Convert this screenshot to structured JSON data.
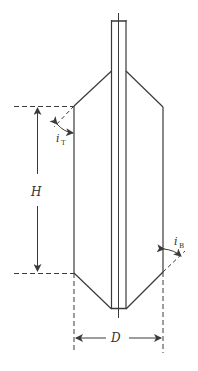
{
  "diagram": {
    "type": "technical cross-section of cylindrical vessel with conical top and bottom and central rod",
    "colors": {
      "stroke": "#3a3a3a",
      "background": "#ffffff"
    },
    "labels": {
      "height": "H",
      "diameter": "D",
      "top_angle": "i",
      "top_angle_sub": "T",
      "bottom_angle": "i",
      "bottom_angle_sub": "B"
    }
  }
}
